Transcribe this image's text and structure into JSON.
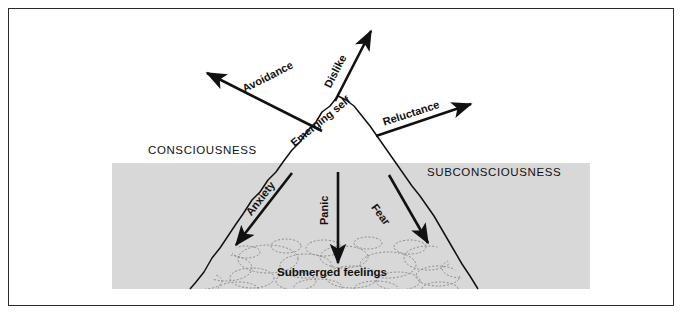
{
  "diagram": {
    "title_visible": false,
    "zones": {
      "conscious": {
        "label": "CONSCIOUSNESS"
      },
      "subconscious": {
        "label": "SUBCONSCIOUSNESS"
      }
    },
    "peak": {
      "label": "Emerging self"
    },
    "deep": {
      "label": "Submerged feelings"
    },
    "arrows_above": [
      {
        "label": "Avoidance"
      },
      {
        "label": "Dislike"
      },
      {
        "label": "Reluctance"
      }
    ],
    "arrows_below": [
      {
        "label": "Anxiety"
      },
      {
        "label": "Panic"
      },
      {
        "label": "Fear"
      }
    ],
    "colors": {
      "band": "#d8d8d8",
      "ink": "#111111",
      "frame": "#2b2b2b",
      "page": "#ffffff"
    }
  }
}
